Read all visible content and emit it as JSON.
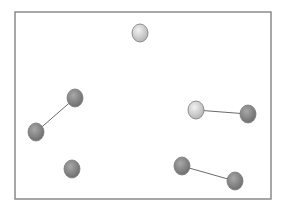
{
  "diagram": {
    "frame": {
      "x": 15,
      "y": 12,
      "width": 256,
      "height": 187,
      "stroke": "#8a8a8a"
    },
    "colors": {
      "light_node_fill_center": "#f2f2f2",
      "light_node_fill_edge": "#b5b5b5",
      "dark_node_fill_center": "#a8a8a8",
      "dark_node_fill_edge": "#6f6f6f",
      "node_stroke": "#7a7a7a",
      "edge_stroke": "#6b6b6b"
    },
    "nodes": [
      {
        "id": "n1",
        "x": 140,
        "y": 33,
        "rx": 8,
        "ry": 9,
        "shade": "light"
      },
      {
        "id": "n2",
        "x": 75,
        "y": 98,
        "rx": 8,
        "ry": 9,
        "shade": "dark"
      },
      {
        "id": "n3",
        "x": 36,
        "y": 132,
        "rx": 8,
        "ry": 9,
        "shade": "dark"
      },
      {
        "id": "n4",
        "x": 196,
        "y": 110,
        "rx": 8,
        "ry": 9,
        "shade": "light"
      },
      {
        "id": "n5",
        "x": 248,
        "y": 114,
        "rx": 8,
        "ry": 9,
        "shade": "dark"
      },
      {
        "id": "n6",
        "x": 72,
        "y": 169,
        "rx": 8,
        "ry": 9,
        "shade": "dark"
      },
      {
        "id": "n7",
        "x": 182,
        "y": 166,
        "rx": 8,
        "ry": 9,
        "shade": "dark"
      },
      {
        "id": "n8",
        "x": 235,
        "y": 181,
        "rx": 8,
        "ry": 9,
        "shade": "dark"
      }
    ],
    "edges": [
      {
        "from": "n2",
        "to": "n3"
      },
      {
        "from": "n4",
        "to": "n5"
      },
      {
        "from": "n7",
        "to": "n8"
      }
    ]
  }
}
